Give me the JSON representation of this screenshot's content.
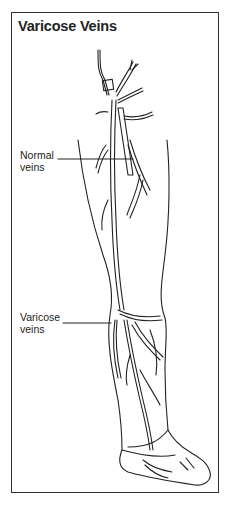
{
  "title": "Varicose Veins",
  "labels": {
    "normal": {
      "line1": "Normal",
      "line2": "veins"
    },
    "varicose": {
      "line1": "Varicose",
      "line2": "veins"
    }
  },
  "colors": {
    "ink": "#222222",
    "border": "#333333",
    "background": "#ffffff"
  }
}
